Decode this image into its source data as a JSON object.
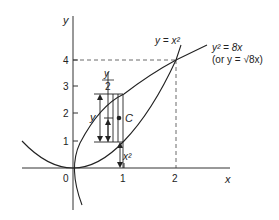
{
  "diagram": {
    "axes": {
      "x_label": "x",
      "y_label": "y",
      "origin_label": "0",
      "x_ticks": [
        "1",
        "2"
      ],
      "y_ticks": [
        "1",
        "2",
        "3",
        "4"
      ]
    },
    "curves": {
      "parabola_label": "y = x²",
      "root_curve_label_line1": "y² = 8x",
      "root_curve_label_line2": "(or y = √8x)"
    },
    "strip": {
      "height_label": "y",
      "half_height_numerator": "y",
      "half_height_denominator": "2",
      "offset_label": "x²",
      "centroid_label": "C"
    }
  }
}
